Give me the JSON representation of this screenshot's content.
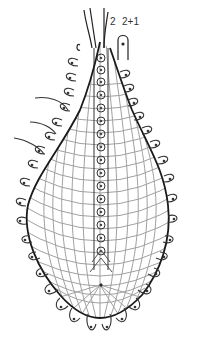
{
  "figure": {
    "labels": [
      {
        "id": "label-2",
        "text": "2"
      },
      {
        "id": "label-2plus1",
        "text": "2+1"
      }
    ],
    "colors": {
      "outline": "#1a1a1a",
      "grid": "#9a9a9a",
      "lobes": "#444444",
      "background": "#ffffff"
    }
  }
}
